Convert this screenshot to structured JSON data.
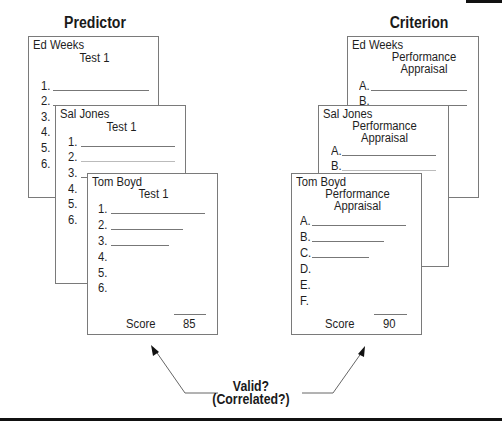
{
  "headings": {
    "predictor": "Predictor",
    "criterion": "Criterion"
  },
  "predictor_cards": [
    {
      "name": "Ed Weeks",
      "title": "Test 1",
      "items": [
        "1.",
        "2.",
        "3.",
        "4.",
        "5.",
        "6."
      ]
    },
    {
      "name": "Sal Jones",
      "title": "Test 1",
      "items": [
        "1.",
        "2.",
        "3.",
        "4.",
        "5.",
        "6."
      ]
    },
    {
      "name": "Tom Boyd",
      "title": "Test 1",
      "items": [
        "1.",
        "2.",
        "3.",
        "4.",
        "5.",
        "6."
      ],
      "score_label": "Score",
      "score_value": "85"
    }
  ],
  "criterion_cards": [
    {
      "name": "Ed Weeks",
      "title_line1": "Performance",
      "title_line2": "Appraisal",
      "items": [
        "A.",
        "B."
      ]
    },
    {
      "name": "Sal Jones",
      "title_line1": "Performance",
      "title_line2": "Appraisal",
      "items": [
        "A.",
        "B."
      ]
    },
    {
      "name": "Tom Boyd",
      "title_line1": "Performance",
      "title_line2": "Appraisal",
      "items": [
        "A.",
        "B.",
        "C.",
        "D.",
        "E.",
        "F."
      ],
      "score_label": "Score",
      "score_value": "90"
    }
  ],
  "relation": {
    "line1": "Valid?",
    "line2": "(Correlated?)"
  },
  "colors": {
    "border": "#7a7a7a",
    "text": "#1e1e1e",
    "rule": "#111111"
  }
}
